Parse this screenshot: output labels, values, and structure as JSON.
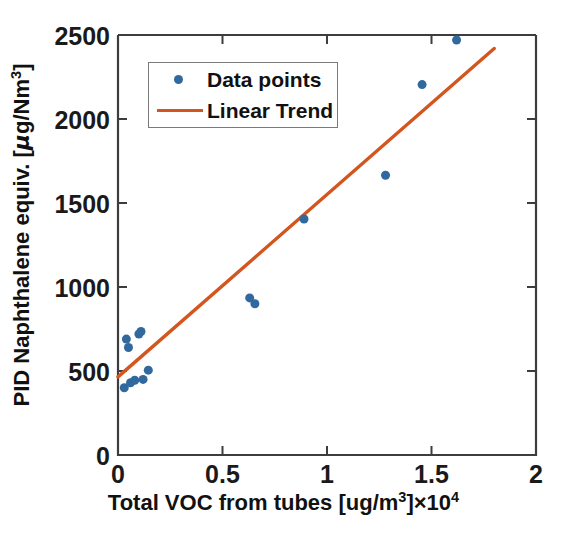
{
  "chart_data": {
    "type": "scatter",
    "title": "",
    "xlabel": "Total VOC from tubes [ug/m3] ×10^4",
    "xlabel_parts": {
      "main": "Total VOC from tubes [ug/m",
      "sup1": "3",
      "mid": "]×10",
      "sup2": "4"
    },
    "ylabel": "PID Naphthalene equiv. [μg/Nm3]",
    "ylabel_parts": {
      "main": "PID Naphthalene equiv. [",
      "mu": "μ",
      "unit": "g/Nm",
      "sup": "3",
      "close": "]"
    },
    "xlim": [
      0,
      2
    ],
    "ylim": [
      0,
      2500
    ],
    "xticks": [
      "0",
      "0.5",
      "1",
      "1.5",
      "2"
    ],
    "xtick_values": [
      0,
      0.5,
      1,
      1.5,
      2
    ],
    "yticks": [
      "0",
      "500",
      "1000",
      "1500",
      "2000",
      "2500"
    ],
    "ytick_values": [
      0,
      500,
      1000,
      1500,
      2000,
      2500
    ],
    "grid": false,
    "legend_position": "upper-left-inside",
    "series": [
      {
        "name": "Data points",
        "type": "scatter",
        "color": "#31699E",
        "marker": "circle",
        "marker_size": 9,
        "x": [
          0.03,
          0.04,
          0.05,
          0.06,
          0.08,
          0.1,
          0.11,
          0.12,
          0.145,
          0.63,
          0.655,
          0.89,
          1.28,
          1.455,
          1.62
        ],
        "y": [
          400,
          690,
          640,
          430,
          445,
          720,
          735,
          450,
          505,
          935,
          900,
          1405,
          1665,
          2205,
          2470
        ]
      },
      {
        "name": "Linear Trend",
        "type": "line",
        "color": "#D4561F",
        "line_width": 3.4,
        "x": [
          0,
          1.8
        ],
        "y": [
          465,
          2420
        ]
      }
    ]
  },
  "legend": {
    "items": [
      {
        "label": "Data points",
        "marker": "circle",
        "color": "#31699E"
      },
      {
        "label": "Linear Trend",
        "marker": "line",
        "color": "#D4561F"
      }
    ]
  },
  "axes": {
    "x_tick_labels": [
      "0",
      "0.5",
      "1",
      "1.5",
      "2"
    ],
    "y_tick_labels": [
      "0",
      "500",
      "1000",
      "1500",
      "2000",
      "2500"
    ]
  },
  "colors": {
    "marker_blue": "#31699E",
    "trend_orange": "#D4561F",
    "axis_line": "#3d3d3d",
    "background": "#ffffff"
  }
}
